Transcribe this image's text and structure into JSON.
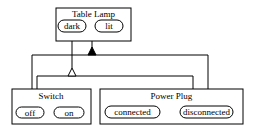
{
  "diagram": {
    "type": "statechart",
    "nodes": {
      "table_lamp": {
        "title": "Table Lamp",
        "states": [
          "dark",
          "lit"
        ]
      },
      "switch": {
        "title": "Switch",
        "states": [
          "off",
          "on"
        ]
      },
      "power_plug": {
        "title": "Power Plug",
        "states": [
          "connected",
          "disconnected"
        ]
      }
    },
    "relations": [
      {
        "from": "table_lamp",
        "to": [
          "switch",
          "power_plug"
        ],
        "marker": "filled-triangle"
      },
      {
        "from": "table_lamp.dark",
        "to": [
          "switch.off",
          "power_plug.disconnected"
        ],
        "marker": "open-triangle"
      }
    ],
    "colors": {
      "stroke": "#000000",
      "background": "#ffffff"
    }
  }
}
